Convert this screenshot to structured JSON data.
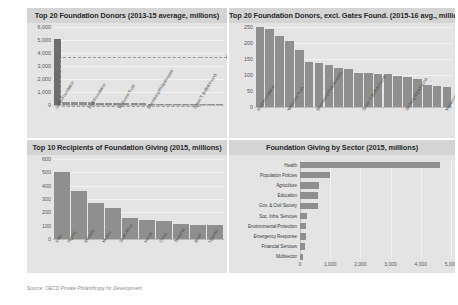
{
  "source_note": "Source: OECD Private Philanthropy for Development",
  "panels": {
    "top_left": {
      "title": "Top 20 Foundation Donors (2013-15 average, millions)"
    },
    "top_right": {
      "title": "Top 20 Foundation Donors, excl. Gates Found. (2015-16 avg., millions)"
    },
    "bottom_left": {
      "title": "Top 10 Recipients of Foundation Giving (2015, millions)"
    },
    "bottom_right": {
      "title": "Foundation Giving by Sector (2015, millions)"
    }
  },
  "chart_data": [
    {
      "type": "bar",
      "id": "top-20-foundation-donors",
      "title": "Top 20 Foundation Donors (2013-15 average, millions)",
      "xlabel": "",
      "ylabel": "",
      "ylim": [
        0,
        6000
      ],
      "yticks": [
        "0",
        "1,000",
        "2,000",
        "3,000",
        "4,000",
        "5,000",
        "6,000"
      ],
      "grid": true,
      "annotation": "dashed callout around the non-Gates bars pointing to the adjacent chart",
      "categories": [
        "Gates Foundation",
        "Ford Foundation",
        "Wellcome Trust",
        "Bloomberg Philanthropies",
        "Susan T. Buffett Found.",
        "Stichting IKEA Found.",
        "Mastercard Foundation",
        "Open Society Foundations",
        "Gordon & Betty Moore",
        "Children's Investment Fund",
        "Bernard van Leer",
        "W.K. Kellogg Foundation",
        "Rockefeller Foundation",
        "MacArthur Foundation",
        "Hewlett Foundation",
        "Carnegie Corporation",
        "Oak Foundation",
        "Packard Foundation",
        "Wyss Foundation",
        "C.S. Mott Foundation"
      ],
      "values": [
        5100,
        250,
        245,
        222,
        205,
        178,
        140,
        136,
        131,
        122,
        120,
        107,
        105,
        103,
        102,
        97,
        93,
        86,
        70,
        66
      ]
    },
    {
      "type": "bar",
      "id": "top-20-foundation-donors-excl-gates",
      "title": "Top 20 Foundation Donors, excl. Gates Found. (2015-16 avg., millions)",
      "xlabel": "",
      "ylabel": "",
      "ylim": [
        0,
        250
      ],
      "yticks": [
        "0",
        "50",
        "100",
        "150",
        "200",
        "250"
      ],
      "grid": true,
      "categories": [
        "Ford Foundation",
        "Wellcome Trust",
        "Bloomberg Philanthropies",
        "Susan T. Buffett Found.",
        "Stichting IKEA Found.",
        "Mastercard Foundation",
        "Open Society Foundations",
        "Gordon & Betty Moore",
        "Children's Investment Fund",
        "Bernard van Leer",
        "W.K. Kellogg Foundation",
        "Rockefeller Foundation",
        "MacArthur Foundation",
        "Hewlett Foundation",
        "Carnegie Corporation",
        "Oak Foundation",
        "Packard Foundation",
        "Wyss Foundation",
        "C.S. Mott Foundation",
        "Bill Gates Trust"
      ],
      "values": [
        250,
        245,
        222,
        205,
        178,
        140,
        136,
        131,
        122,
        120,
        107,
        105,
        103,
        102,
        97,
        93,
        86,
        70,
        66,
        64
      ]
    },
    {
      "type": "bar",
      "id": "top-10-recipients",
      "title": "Top 10 Recipients of Foundation Giving (2015, millions)",
      "xlabel": "",
      "ylabel": "",
      "ylim": [
        0,
        600
      ],
      "yticks": [
        "0",
        "100",
        "200",
        "300",
        "400",
        "500",
        "600"
      ],
      "grid": true,
      "categories": [
        "India",
        "Nigeria",
        "Ethiopia",
        "Mexico",
        "South Africa",
        "Kenya",
        "China",
        "Tanzania",
        "Brazil",
        "Uganda"
      ],
      "values": [
        505,
        358,
        268,
        232,
        160,
        140,
        135,
        110,
        105,
        105
      ]
    },
    {
      "type": "bar",
      "id": "giving-by-sector",
      "orientation": "horizontal",
      "title": "Foundation Giving by Sector (2015, millions)",
      "xlabel": "",
      "ylabel": "",
      "xlim": [
        0,
        5000
      ],
      "xticks": [
        "0",
        "1,000",
        "2,000",
        "3,000",
        "4,000",
        "5,000"
      ],
      "grid": true,
      "categories": [
        "Health",
        "Population Policies",
        "Agriculture",
        "Education",
        "Gov. & Civil Society",
        "Soc. Infra. Services",
        "Environmental Protection",
        "Emergency Response",
        "Financial Services",
        "Multisector"
      ],
      "values": [
        4650,
        980,
        640,
        600,
        580,
        225,
        200,
        190,
        175,
        110
      ]
    }
  ]
}
